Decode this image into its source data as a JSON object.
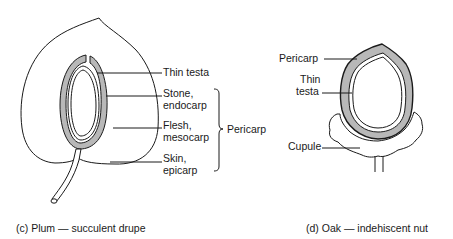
{
  "figures": [
    {
      "id": "plum",
      "caption": "(c) Plum — succulent drupe",
      "labels": {
        "thin_testa": "Thin testa",
        "stone_1": "Stone,",
        "stone_2": "endocarp",
        "flesh_1": "Flesh,",
        "flesh_2": "mesocarp",
        "skin_1": "Skin,",
        "skin_2": "epicarp",
        "bracket_label": "Pericarp"
      }
    },
    {
      "id": "oak",
      "caption": "(d) Oak — indehiscent nut",
      "labels": {
        "pericarp": "Pericarp",
        "thin_1": "Thin",
        "thin_2": "testa",
        "cupule": "Cupule"
      }
    }
  ],
  "colors": {
    "line": "#1a1a1a",
    "shaded_layer": "#b8b8b8",
    "background": "#ffffff"
  }
}
